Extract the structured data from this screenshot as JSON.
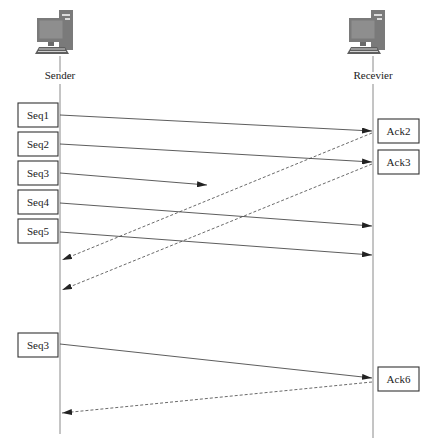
{
  "diagram": {
    "type": "sequence",
    "title": "",
    "colors": {
      "line": "#333333",
      "lifeline": "#8a8a8a",
      "computer": "#777777",
      "background": "#ffffff"
    },
    "participants": [
      {
        "id": "sender",
        "label": "Sender",
        "icon": "desktop-computer-icon",
        "x": 60
      },
      {
        "id": "receiver",
        "label": "Recevier",
        "icon": "desktop-computer-icon",
        "x": 373
      }
    ],
    "sender_boxes": [
      {
        "label": "Seq1",
        "y": 115
      },
      {
        "label": "Seq2",
        "y": 144
      },
      {
        "label": "Seq3",
        "y": 173
      },
      {
        "label": "Seq4",
        "y": 203
      },
      {
        "label": "Seq5",
        "y": 232
      },
      {
        "label": "Seq3",
        "y": 345
      }
    ],
    "receiver_boxes": [
      {
        "label": "Ack2",
        "y": 131
      },
      {
        "label": "Ack3",
        "y": 162
      },
      {
        "label": "Ack6",
        "y": 379
      }
    ],
    "messages": [
      {
        "from": "sender",
        "to": "receiver",
        "label": "Seq1",
        "style": "solid",
        "status": "delivered"
      },
      {
        "from": "sender",
        "to": "receiver",
        "label": "Seq2",
        "style": "solid",
        "status": "delivered"
      },
      {
        "from": "sender",
        "to": "receiver",
        "label": "Seq3",
        "style": "solid",
        "status": "lost"
      },
      {
        "from": "sender",
        "to": "receiver",
        "label": "Seq4",
        "style": "solid",
        "status": "delivered"
      },
      {
        "from": "sender",
        "to": "receiver",
        "label": "Seq5",
        "style": "solid",
        "status": "delivered"
      },
      {
        "from": "receiver",
        "to": "sender",
        "label": "Ack2",
        "style": "dashed",
        "status": "delivered"
      },
      {
        "from": "receiver",
        "to": "sender",
        "label": "Ack3",
        "style": "dashed",
        "status": "delivered"
      },
      {
        "from": "sender",
        "to": "receiver",
        "label": "Seq3",
        "style": "solid",
        "status": "retransmitted"
      },
      {
        "from": "receiver",
        "to": "sender",
        "label": "Ack6",
        "style": "dashed",
        "status": "delivered"
      }
    ]
  }
}
